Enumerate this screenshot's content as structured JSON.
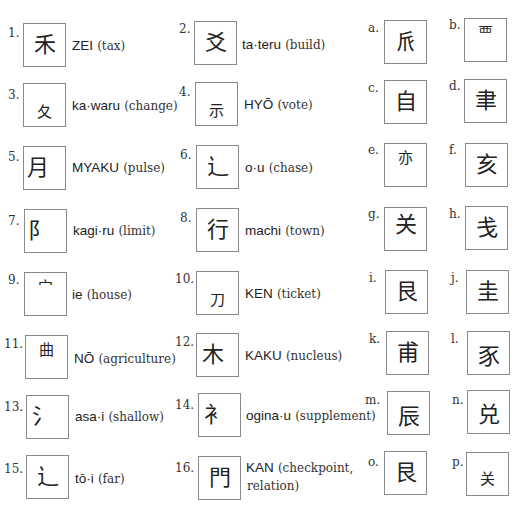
{
  "header_partial": "",
  "questions": [
    {
      "num": "1.",
      "glyph": "禾",
      "reading": "ZEI",
      "meaning": "(tax)"
    },
    {
      "num": "2.",
      "glyph": "爻",
      "reading": "ta·teru",
      "meaning": "(build)"
    },
    {
      "num": "3.",
      "glyph": "夂",
      "reading": "ka·waru",
      "meaning": "(change)"
    },
    {
      "num": "4.",
      "glyph": "示",
      "reading": "HYŌ",
      "meaning": "(vote)"
    },
    {
      "num": "5.",
      "glyph": "月",
      "reading": "MYAKU",
      "meaning": "(pulse)"
    },
    {
      "num": "6.",
      "glyph": "辶",
      "reading": "o·u",
      "meaning": "(chase)"
    },
    {
      "num": "7.",
      "glyph": "阝",
      "reading": "kagi·ru",
      "meaning": "(limit)"
    },
    {
      "num": "8.",
      "glyph": "行",
      "reading": "machi",
      "meaning": "(town)"
    },
    {
      "num": "9.",
      "glyph": "宀",
      "reading": "ie",
      "meaning": "(house)"
    },
    {
      "num": "10.",
      "glyph": "刀",
      "reading": "KEN",
      "meaning": "(ticket)"
    },
    {
      "num": "11.",
      "glyph": "曲",
      "reading": "NŌ",
      "meaning": "(agriculture)"
    },
    {
      "num": "12.",
      "glyph": "木",
      "reading": "KAKU",
      "meaning": "(nucleus)"
    },
    {
      "num": "13.",
      "glyph": "氵",
      "reading": "asa·i",
      "meaning": "(shallow)"
    },
    {
      "num": "14.",
      "glyph": "衤",
      "reading": "ogina·u",
      "meaning": "(supplement)"
    },
    {
      "num": "15.",
      "glyph": "辶",
      "reading": "tō·i",
      "meaning": "(far)"
    },
    {
      "num": "16.",
      "glyph": "門",
      "reading": "KAN",
      "meaning": "(checkpoint,",
      "meaning2": "relation)"
    }
  ],
  "options": [
    {
      "letter": "a.",
      "glyph": "𠂢"
    },
    {
      "letter": "b.",
      "glyph": "覀"
    },
    {
      "letter": "c.",
      "glyph": "自"
    },
    {
      "letter": "d.",
      "glyph": "聿"
    },
    {
      "letter": "e.",
      "glyph": "亦"
    },
    {
      "letter": "f.",
      "glyph": "亥"
    },
    {
      "letter": "g.",
      "glyph": "关"
    },
    {
      "letter": "h.",
      "glyph": "戋"
    },
    {
      "letter": "i.",
      "glyph": "艮"
    },
    {
      "letter": "j.",
      "glyph": "圭"
    },
    {
      "letter": "k.",
      "glyph": "甫"
    },
    {
      "letter": "l.",
      "glyph": "豕"
    },
    {
      "letter": "m.",
      "glyph": "辰"
    },
    {
      "letter": "n.",
      "glyph": "兑"
    },
    {
      "letter": "o.",
      "glyph": "艮"
    },
    {
      "letter": "p.",
      "glyph": "关"
    }
  ]
}
